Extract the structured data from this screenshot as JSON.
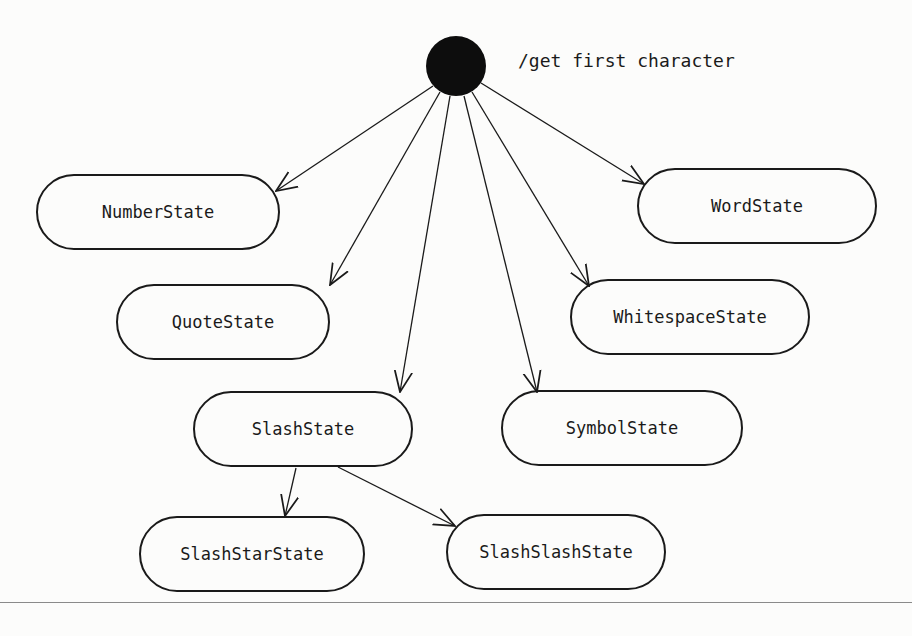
{
  "diagram": {
    "initial_label": "/get first character",
    "states": [
      {
        "id": "number",
        "label": "NumberState"
      },
      {
        "id": "quote",
        "label": "QuoteState"
      },
      {
        "id": "slash",
        "label": "SlashState"
      },
      {
        "id": "symbol",
        "label": "SymbolState"
      },
      {
        "id": "whitespace",
        "label": "WhitespaceState"
      },
      {
        "id": "word",
        "label": "WordState"
      },
      {
        "id": "slashstar",
        "label": "SlashStarState"
      },
      {
        "id": "slashslash",
        "label": "SlashSlashState"
      }
    ],
    "transitions": [
      {
        "from": "initial",
        "to": "number"
      },
      {
        "from": "initial",
        "to": "quote"
      },
      {
        "from": "initial",
        "to": "slash"
      },
      {
        "from": "initial",
        "to": "symbol"
      },
      {
        "from": "initial",
        "to": "whitespace"
      },
      {
        "from": "initial",
        "to": "word"
      },
      {
        "from": "slash",
        "to": "slashstar"
      },
      {
        "from": "slash",
        "to": "slashslash"
      }
    ]
  }
}
